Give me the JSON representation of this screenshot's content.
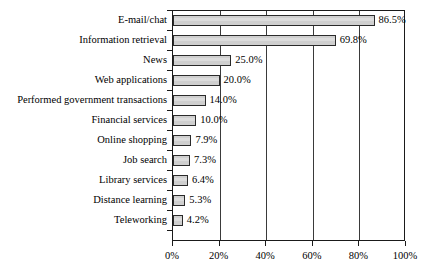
{
  "chart_data": {
    "type": "bar",
    "orientation": "horizontal",
    "title": "",
    "xlabel": "",
    "ylabel": "",
    "xlim": [
      0,
      100
    ],
    "xtick_labels": [
      "0%",
      "20%",
      "40%",
      "60%",
      "80%",
      "100%"
    ],
    "xticks": [
      0,
      20,
      40,
      60,
      80,
      100
    ],
    "grid": "vertical",
    "legend": "none",
    "categories": [
      "E-mail/chat",
      "Information retrieval",
      "News",
      "Web applications",
      "Performed government transactions",
      "Financial services",
      "Online shopping",
      "Job search",
      "Library services",
      "Distance learning",
      "Teleworking"
    ],
    "values": [
      86.5,
      69.8,
      25.0,
      20.0,
      14.0,
      10.0,
      7.9,
      7.3,
      6.4,
      5.3,
      4.2
    ],
    "value_labels": [
      "86.5%",
      "69.8%",
      "25.0%",
      "20.0%",
      "14.0%",
      "10.0%",
      "7.9%",
      "7.3%",
      "6.4%",
      "5.3%",
      "4.2%"
    ],
    "bar_fill_color": "#cfcfcf",
    "bar_border_color": "#2a2a2a",
    "axis_color": "#1a1a1a",
    "grid_color": "#3a3a3a",
    "background_color": "#ffffff"
  }
}
